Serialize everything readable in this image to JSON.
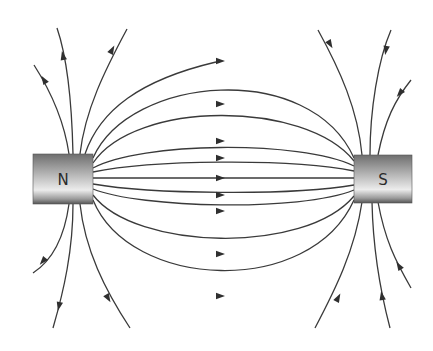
{
  "diagram": {
    "magnets": [
      {
        "pole": "N",
        "label": "N",
        "x": 33,
        "y": 154,
        "w": 60,
        "h": 50
      },
      {
        "pole": "S",
        "label": "S",
        "x": 354,
        "y": 155,
        "w": 58,
        "h": 48
      }
    ],
    "colors": {
      "line": "#3a3a3a",
      "magnet_dark": "#6e6e6e",
      "magnet_light": "#e8e8e8"
    },
    "field_lines_between": [
      {
        "d": "M93,158 C130,75 310,60 354,158",
        "arrow": [
          220,
          61
        ]
      },
      {
        "d": "M93,163 C135,100 305,100 354,161",
        "arrow": [
          220,
          104
        ]
      },
      {
        "d": "M93,168 C140,142 300,140 354,166",
        "arrow": [
          220,
          141
        ]
      },
      {
        "d": "M93,172 C150,160 290,158 354,171",
        "arrow": [
          220,
          158
        ]
      },
      {
        "d": "M93,178 L354,178",
        "arrow": [
          220,
          178
        ]
      },
      {
        "d": "M93,184 C150,194 290,196 354,185",
        "arrow": [
          220,
          195
        ]
      },
      {
        "d": "M93,189 C140,208 300,212 354,190",
        "arrow": [
          220,
          211
        ]
      },
      {
        "d": "M93,195 C135,250 305,255 354,196",
        "arrow": [
          220,
          254
        ]
      },
      {
        "d": "M93,200 C130,290 310,298 354,200",
        "arrow": [
          220,
          296
        ]
      }
    ],
    "field_lines_outer": [
      {
        "d": "M69,154 C64,120 50,90 34,65",
        "arrow": [
          44,
          80
        ],
        "angle": -122
      },
      {
        "d": "M73,154 C72,110 68,60 57,28",
        "arrow": [
          63,
          56
        ],
        "angle": -102
      },
      {
        "d": "M80,154 C85,110 105,70 127,29",
        "arrow": [
          112,
          50
        ],
        "angle": -62
      },
      {
        "d": "M85,154 C100,110 140,80 216,62",
        "arrow": null,
        "angle": 0
      },
      {
        "d": "M69,204 C64,240 50,262 33,273",
        "arrow": [
          43,
          261
        ],
        "angle": 130
      },
      {
        "d": "M73,204 C73,250 64,290 53,328",
        "arrow": [
          59,
          306
        ],
        "angle": 103
      },
      {
        "d": "M80,204 C85,250 105,290 130,328",
        "arrow": [
          108,
          298
        ],
        "angle": 60
      },
      {
        "d": "M362,155 C358,110 340,70 318,30",
        "arrow": [
          330,
          44
        ],
        "angle": 60
      },
      {
        "d": "M370,155 C370,110 378,60 391,30",
        "arrow": [
          386,
          50
        ],
        "angle": 100
      },
      {
        "d": "M378,155 C385,120 395,100 411,80",
        "arrow": [
          400,
          93
        ],
        "angle": 130
      },
      {
        "d": "M362,202 C355,250 335,290 315,328",
        "arrow": [
          338,
          298
        ],
        "angle": -62
      },
      {
        "d": "M372,202 C373,250 380,290 390,328",
        "arrow": [
          382,
          296
        ],
        "angle": -100
      },
      {
        "d": "M378,202 C385,240 395,260 411,288",
        "arrow": [
          399,
          266
        ],
        "angle": -122
      }
    ]
  }
}
